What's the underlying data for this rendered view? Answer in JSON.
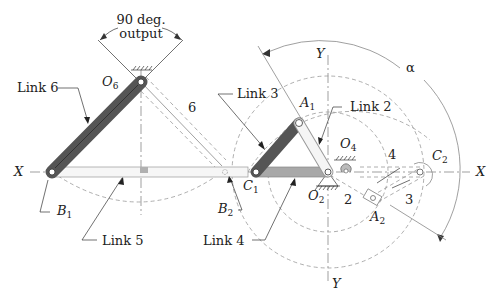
{
  "diagram": {
    "title_annotation": {
      "line1": "90 deg.",
      "line2": "output"
    },
    "labels": {
      "link6": "Link  6",
      "link5": "Link  5",
      "link4": "Link 4",
      "link3": "Link 3",
      "link2": "Link 2",
      "num6": "6",
      "num4": "4",
      "num3": "3",
      "num2": "2",
      "alpha": "α",
      "x_left": "X",
      "x_right": "X",
      "y_top": "Y",
      "y_bottom": "Y"
    },
    "points": {
      "O6": {
        "base": "O",
        "sub": "6"
      },
      "O4": {
        "base": "O",
        "sub": "4"
      },
      "O2": {
        "base": "O",
        "sub": "2"
      },
      "A1": {
        "base": "A",
        "sub": "1"
      },
      "A2": {
        "base": "A",
        "sub": "2"
      },
      "B1": {
        "base": "B",
        "sub": "1"
      },
      "B2": {
        "base": "B",
        "sub": "2"
      },
      "C1": {
        "base": "C",
        "sub": "1"
      },
      "C2": {
        "base": "C",
        "sub": "2"
      }
    },
    "colors": {
      "dark_link": "#555555",
      "light_link": "#a8a8a8",
      "outline_link": "#f4f4f4",
      "construction": "#999999"
    }
  }
}
